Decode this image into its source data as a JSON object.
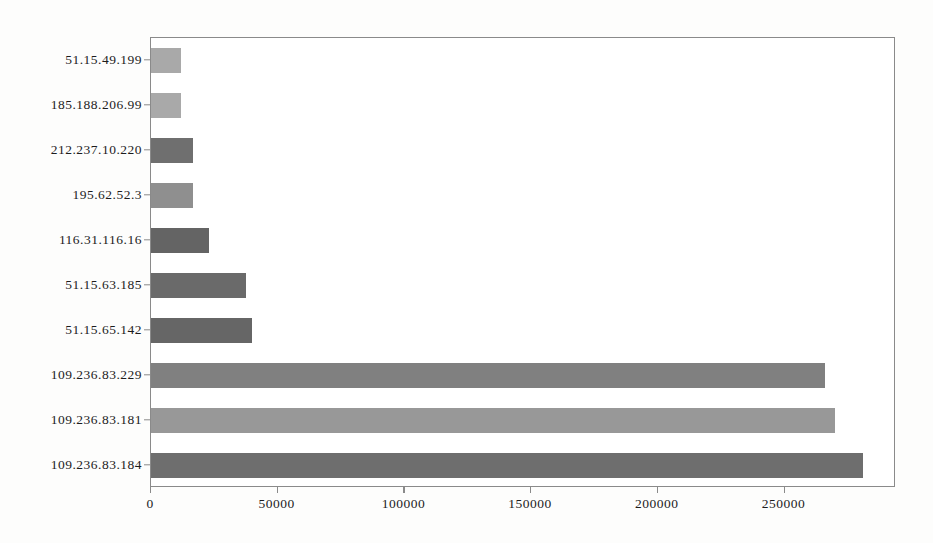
{
  "chart_data": {
    "type": "bar",
    "orientation": "horizontal",
    "title": "",
    "xlabel": "",
    "ylabel": "",
    "categories": [
      "51.15.49.199",
      "185.188.206.99",
      "212.237.10.220",
      "195.62.52.3",
      "116.31.116.16",
      "51.15.63.185",
      "51.15.65.142",
      "109.236.83.229",
      "109.236.83.181",
      "109.236.83.184"
    ],
    "values": [
      12000,
      12000,
      16500,
      16500,
      23000,
      37500,
      40000,
      266000,
      270000,
      281000
    ],
    "xlim": [
      0,
      294000
    ],
    "xticks": [
      0,
      50000,
      100000,
      150000,
      200000,
      250000
    ],
    "xticklabels": [
      "0",
      "50000",
      "100000",
      "150000",
      "200000",
      "250000"
    ],
    "grid": false,
    "legend": null,
    "bar_colors": [
      "#a9a9a9",
      "#a9a9a9",
      "#6f6f6f",
      "#8f8f8f",
      "#646464",
      "#6a6a6a",
      "#666666",
      "#808080",
      "#989898",
      "#6e6e6e"
    ]
  },
  "colors": {
    "frame": "#8a8a8a",
    "background": "#ffffff",
    "text": "#1c1c1c"
  }
}
